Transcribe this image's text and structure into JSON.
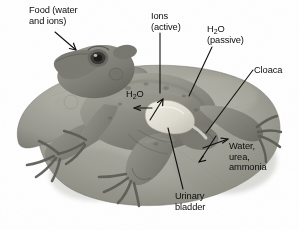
{
  "figure": {
    "background_color": "#ffffff",
    "labels": {
      "food": {
        "line1": "Food (water",
        "line2": "and ions)"
      },
      "ions": {
        "line1": "Ions",
        "line2": "(active)"
      },
      "h2o_passive": {
        "line1_a": "H",
        "line1_sub": "2",
        "line1_b": "O",
        "line2": "(passive)"
      },
      "cloaca": {
        "line1": "Cloaca"
      },
      "h2o_internal": {
        "line1_a": "H",
        "line1_sub": "2",
        "line1_b": "O"
      },
      "waste": {
        "line1": "Water,",
        "line2": "urea,",
        "line3": "ammonia"
      },
      "urinary_bladder": {
        "line1": "Urinary",
        "line2": "bladder"
      }
    },
    "colors": {
      "pad_light": "#b9b9af",
      "pad_mid": "#9d9d93",
      "pad_dark": "#7e7e76",
      "frog_light": "#a3a39a",
      "frog_mid": "#8b8b82",
      "frog_dark": "#6d6d66",
      "bladder": "#e4e2d6",
      "text": "#0d0d0d",
      "leader": "#111111"
    }
  }
}
